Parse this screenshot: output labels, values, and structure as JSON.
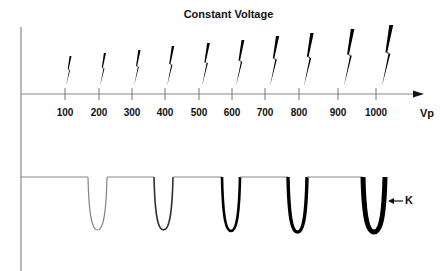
{
  "title": "Constant Voltage",
  "x_axis": {
    "label": "Vp",
    "ticks": [
      {
        "label": "100",
        "x": 65
      },
      {
        "label": "200",
        "x": 99
      },
      {
        "label": "300",
        "x": 132
      },
      {
        "label": "400",
        "x": 165
      },
      {
        "label": "500",
        "x": 199
      },
      {
        "label": "600",
        "x": 232
      },
      {
        "label": "700",
        "x": 265
      },
      {
        "label": "800",
        "x": 299
      },
      {
        "label": "900",
        "x": 338
      },
      {
        "label": "1000",
        "x": 376
      }
    ]
  },
  "bolts": [
    {
      "x": 70,
      "height": 30
    },
    {
      "x": 104,
      "height": 33
    },
    {
      "x": 138,
      "height": 36
    },
    {
      "x": 171,
      "height": 40
    },
    {
      "x": 206,
      "height": 43
    },
    {
      "x": 240,
      "height": 46
    },
    {
      "x": 274,
      "height": 50
    },
    {
      "x": 308,
      "height": 53
    },
    {
      "x": 348,
      "height": 57
    },
    {
      "x": 386,
      "height": 61
    }
  ],
  "dips": [
    {
      "x1": 88,
      "x2": 107,
      "depth": 53,
      "stroke": 1.2,
      "color": "#888888"
    },
    {
      "x1": 154,
      "x2": 173,
      "depth": 53,
      "stroke": 1.6,
      "color": "#333333"
    },
    {
      "x1": 222,
      "x2": 240,
      "depth": 54,
      "stroke": 2.6,
      "color": "#000000"
    },
    {
      "x1": 288,
      "x2": 307,
      "depth": 55,
      "stroke": 3.4,
      "color": "#000000"
    },
    {
      "x1": 363,
      "x2": 385,
      "depth": 55,
      "stroke": 5.0,
      "color": "#000000"
    }
  ],
  "annotation": {
    "label": "K"
  },
  "colors": {
    "axis": "#888888",
    "ink": "#000000"
  }
}
